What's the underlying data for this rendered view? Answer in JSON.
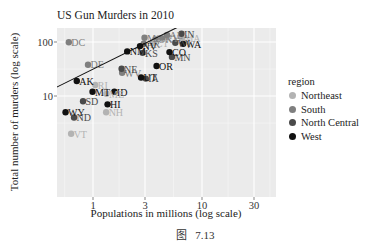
{
  "caption": "图  7.13",
  "chart_data": {
    "type": "scatter",
    "title": "US Gun Murders in 2010",
    "xlabel": "Populations in millions (log scale)",
    "ylabel": "Total number of murders (log scale)",
    "x_scale": "log10",
    "y_scale": "log10",
    "xlim": [
      0.45,
      45
    ],
    "ylim": [
      1.4,
      1800
    ],
    "x_ticks": [
      1,
      3,
      10,
      30
    ],
    "x_tick_labels": [
      "1",
      "3",
      "10",
      "30"
    ],
    "y_ticks": [
      10,
      100,
      1000
    ],
    "y_tick_labels": [
      "10",
      "100",
      "1000"
    ],
    "grid": true,
    "legend_position": "right",
    "legend": {
      "title": "region",
      "entries": [
        {
          "name": "Northeast",
          "color": "#b3b3b3"
        },
        {
          "name": "South",
          "color": "#7f7f7f"
        },
        {
          "name": "North Central",
          "color": "#4a4a4a"
        },
        {
          "name": "West",
          "color": "#111111"
        }
      ]
    },
    "regression_line": {
      "intercept_log10": 1.497,
      "slope": 1,
      "color": "#111111",
      "description": "y = rate * x, average murder rate ~2.8 per 100k"
    },
    "points": [
      {
        "state": "CA",
        "pop": 37.25,
        "murders": 1257,
        "region": "West"
      },
      {
        "state": "TX",
        "pop": 25.15,
        "murders": 805,
        "region": "South"
      },
      {
        "state": "FL",
        "pop": 19.69,
        "murders": 669,
        "region": "South"
      },
      {
        "state": "NY",
        "pop": 19.38,
        "murders": 517,
        "region": "Northeast"
      },
      {
        "state": "IL",
        "pop": 12.83,
        "murders": 364,
        "region": "North Central"
      },
      {
        "state": "PA",
        "pop": 12.7,
        "murders": 457,
        "region": "Northeast"
      },
      {
        "state": "OH",
        "pop": 11.54,
        "murders": 310,
        "region": "North Central"
      },
      {
        "state": "MI",
        "pop": 9.88,
        "murders": 413,
        "region": "North Central"
      },
      {
        "state": "GA",
        "pop": 9.92,
        "murders": 376,
        "region": "South"
      },
      {
        "state": "NC",
        "pop": 9.54,
        "murders": 286,
        "region": "South"
      },
      {
        "state": "NJ",
        "pop": 8.79,
        "murders": 246,
        "region": "Northeast"
      },
      {
        "state": "VA",
        "pop": 8.0,
        "murders": 250,
        "region": "South"
      },
      {
        "state": "WA",
        "pop": 6.72,
        "murders": 93,
        "region": "West"
      },
      {
        "state": "AZ",
        "pop": 6.39,
        "murders": 232,
        "region": "West"
      },
      {
        "state": "MA",
        "pop": 6.55,
        "murders": 118,
        "region": "Northeast"
      },
      {
        "state": "IN",
        "pop": 6.48,
        "murders": 142,
        "region": "North Central"
      },
      {
        "state": "TN",
        "pop": 6.35,
        "murders": 219,
        "region": "South"
      },
      {
        "state": "MO",
        "pop": 5.99,
        "murders": 321,
        "region": "North Central"
      },
      {
        "state": "MD",
        "pop": 5.77,
        "murders": 293,
        "region": "South"
      },
      {
        "state": "WI",
        "pop": 5.69,
        "murders": 97,
        "region": "North Central"
      },
      {
        "state": "MN",
        "pop": 5.3,
        "murders": 53,
        "region": "North Central"
      },
      {
        "state": "CO",
        "pop": 5.03,
        "murders": 65,
        "region": "West"
      },
      {
        "state": "AL",
        "pop": 4.78,
        "murders": 135,
        "region": "South"
      },
      {
        "state": "SC",
        "pop": 4.63,
        "murders": 207,
        "region": "South"
      },
      {
        "state": "LA",
        "pop": 4.53,
        "murders": 351,
        "region": "South"
      },
      {
        "state": "KY",
        "pop": 4.34,
        "murders": 116,
        "region": "South"
      },
      {
        "state": "OR",
        "pop": 3.83,
        "murders": 36,
        "region": "West"
      },
      {
        "state": "OK",
        "pop": 3.75,
        "murders": 111,
        "region": "South"
      },
      {
        "state": "CT",
        "pop": 3.57,
        "murders": 97,
        "region": "Northeast"
      },
      {
        "state": "IA",
        "pop": 3.05,
        "murders": 21,
        "region": "North Central"
      },
      {
        "state": "MS",
        "pop": 2.97,
        "murders": 120,
        "region": "South"
      },
      {
        "state": "AR",
        "pop": 2.92,
        "murders": 93,
        "region": "South"
      },
      {
        "state": "KS",
        "pop": 2.85,
        "murders": 63,
        "region": "North Central"
      },
      {
        "state": "UT",
        "pop": 2.76,
        "murders": 22,
        "region": "West"
      },
      {
        "state": "NV",
        "pop": 2.7,
        "murders": 84,
        "region": "West"
      },
      {
        "state": "NM",
        "pop": 2.06,
        "murders": 67,
        "region": "West"
      },
      {
        "state": "WV",
        "pop": 1.85,
        "murders": 27,
        "region": "South"
      },
      {
        "state": "NE",
        "pop": 1.83,
        "murders": 32,
        "region": "North Central"
      },
      {
        "state": "ID",
        "pop": 1.57,
        "murders": 12,
        "region": "West"
      },
      {
        "state": "HI",
        "pop": 1.36,
        "murders": 7,
        "region": "West"
      },
      {
        "state": "ME",
        "pop": 1.33,
        "murders": 11,
        "region": "Northeast"
      },
      {
        "state": "NH",
        "pop": 1.32,
        "murders": 5,
        "region": "Northeast"
      },
      {
        "state": "RI",
        "pop": 1.05,
        "murders": 16,
        "region": "Northeast"
      },
      {
        "state": "MT",
        "pop": 0.99,
        "murders": 12,
        "region": "West"
      },
      {
        "state": "DE",
        "pop": 0.9,
        "murders": 38,
        "region": "South"
      },
      {
        "state": "SD",
        "pop": 0.81,
        "murders": 8,
        "region": "North Central"
      },
      {
        "state": "AK",
        "pop": 0.71,
        "murders": 19,
        "region": "West"
      },
      {
        "state": "ND",
        "pop": 0.67,
        "murders": 4,
        "region": "North Central"
      },
      {
        "state": "VT",
        "pop": 0.63,
        "murders": 2,
        "region": "Northeast"
      },
      {
        "state": "DC",
        "pop": 0.6,
        "murders": 99,
        "region": "South"
      },
      {
        "state": "WY",
        "pop": 0.56,
        "murders": 5,
        "region": "West"
      }
    ]
  }
}
